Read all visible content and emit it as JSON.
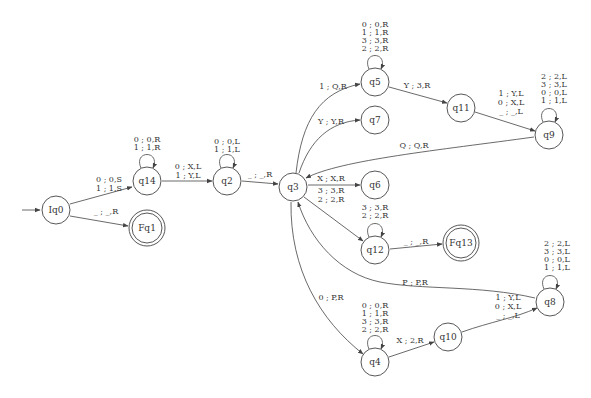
{
  "diagram": {
    "type": "turing-machine-state-diagram",
    "colors": {
      "stroke": "#444444",
      "text": "#333333",
      "background": "#ffffff"
    },
    "initial_state": "Iq0",
    "nodes": [
      {
        "id": "Iq0",
        "label": "Iq0",
        "x": 56,
        "y": 210,
        "accepting": false
      },
      {
        "id": "Fq1",
        "label": "Fq1",
        "x": 147,
        "y": 228,
        "accepting": true
      },
      {
        "id": "q14",
        "label": "q14",
        "x": 147,
        "y": 181,
        "accepting": false
      },
      {
        "id": "q2",
        "label": "q2",
        "x": 227,
        "y": 181,
        "accepting": false
      },
      {
        "id": "q3",
        "label": "q3",
        "x": 293,
        "y": 187,
        "accepting": false
      },
      {
        "id": "q5",
        "label": "q5",
        "x": 375,
        "y": 82,
        "accepting": false
      },
      {
        "id": "q7",
        "label": "q7",
        "x": 375,
        "y": 120,
        "accepting": false
      },
      {
        "id": "q6",
        "label": "q6",
        "x": 375,
        "y": 185,
        "accepting": false
      },
      {
        "id": "q12",
        "label": "q12",
        "x": 375,
        "y": 250,
        "accepting": false
      },
      {
        "id": "Fq13",
        "label": "Fq13",
        "x": 461,
        "y": 243,
        "accepting": true
      },
      {
        "id": "q11",
        "label": "q11",
        "x": 461,
        "y": 108,
        "accepting": false
      },
      {
        "id": "q9",
        "label": "q9",
        "x": 549,
        "y": 135,
        "accepting": false
      },
      {
        "id": "q4",
        "label": "q4",
        "x": 375,
        "y": 362,
        "accepting": false
      },
      {
        "id": "q10",
        "label": "q10",
        "x": 448,
        "y": 337,
        "accepting": false
      },
      {
        "id": "q8",
        "label": "q8",
        "x": 550,
        "y": 302,
        "accepting": false
      }
    ],
    "edges": [
      {
        "from": "Iq0",
        "to": "q14",
        "labels": [
          "0 ; 0,S",
          "1 ; 1,S"
        ]
      },
      {
        "from": "Iq0",
        "to": "Fq1",
        "labels": [
          "_ ; _,R"
        ]
      },
      {
        "from": "q14",
        "to": "q14",
        "labels": [
          "0 ; 0,R",
          "1 ; 1,R"
        ]
      },
      {
        "from": "q14",
        "to": "q2",
        "labels": [
          "0 ; X,L",
          "1 ; Y,L"
        ]
      },
      {
        "from": "q2",
        "to": "q2",
        "labels": [
          "0 ; 0,L",
          "1 ; 1,L"
        ]
      },
      {
        "from": "q2",
        "to": "q3",
        "labels": [
          "_ ; _,R"
        ]
      },
      {
        "from": "q3",
        "to": "q5",
        "labels": [
          "1 ; Q,R"
        ]
      },
      {
        "from": "q3",
        "to": "q7",
        "labels": [
          "Y ; Y,R"
        ]
      },
      {
        "from": "q3",
        "to": "q6",
        "labels": [
          "X ; X,R"
        ]
      },
      {
        "from": "q3",
        "to": "q12",
        "labels": [
          "3 ; 3,R",
          "2 ; 2,R"
        ]
      },
      {
        "from": "q3",
        "to": "q4",
        "labels": [
          "0 ; P,R"
        ]
      },
      {
        "from": "q5",
        "to": "q5",
        "labels": [
          "0 ; 0,R",
          "1 ; 1,R",
          "3 ; 3,R",
          "2 ; 2,R"
        ]
      },
      {
        "from": "q5",
        "to": "q11",
        "labels": [
          "Y ; 3,R"
        ]
      },
      {
        "from": "q11",
        "to": "q9",
        "labels": [
          "1 ; Y,L",
          "0 ; X,L",
          "_ ; _,L"
        ]
      },
      {
        "from": "q9",
        "to": "q9",
        "labels": [
          "2 ; 2,L",
          "3 ; 3,L",
          "0 ; 0,L",
          "1 ; 1,L"
        ]
      },
      {
        "from": "q9",
        "to": "q3",
        "labels": [
          "Q ; Q,R"
        ]
      },
      {
        "from": "q12",
        "to": "q12",
        "labels": [
          "3 ; 3,R",
          "2 ; 2,R"
        ]
      },
      {
        "from": "q12",
        "to": "Fq13",
        "labels": [
          "_ ; _,R"
        ]
      },
      {
        "from": "q8",
        "to": "q3",
        "labels": [
          "P ; P,R"
        ]
      },
      {
        "from": "q8",
        "to": "q8",
        "labels": [
          "2 ; 2,L",
          "3 ; 3,L",
          "0 ; 0,L",
          "1 ; 1,L"
        ]
      },
      {
        "from": "q4",
        "to": "q4",
        "labels": [
          "0 ; 0,R",
          "1 ; 1,R",
          "3 ; 3,R",
          "2 ; 2,R"
        ]
      },
      {
        "from": "q4",
        "to": "q10",
        "labels": [
          "X ; 2,R"
        ]
      },
      {
        "from": "q10",
        "to": "q8",
        "labels": [
          "1 ; Y,L",
          "0 ; X,L",
          "_ ; _,L"
        ]
      }
    ]
  }
}
